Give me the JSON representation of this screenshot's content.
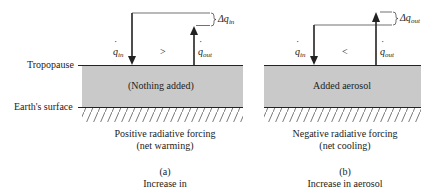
{
  "labels": {
    "tropopause": "Tropopause",
    "earth_surface": "Earth's surface"
  },
  "panel_a": {
    "layer_text": "(Nothing added)",
    "q_in": "q",
    "q_in_sub": "in",
    "q_out": "q",
    "q_out_sub": "out",
    "comparison": ">",
    "delta_label": "Δq",
    "delta_sub": "in",
    "caption_line1": "Positive radiative forcing",
    "caption_line2": "(net warming)",
    "letter": "(a)",
    "subtitle": "Increase in"
  },
  "panel_b": {
    "layer_text": "Added aerosol",
    "q_in": "q",
    "q_in_sub": "in",
    "q_out": "q",
    "q_out_sub": "out",
    "comparison": "<",
    "delta_label": "Δq",
    "delta_sub": "out",
    "caption_line1": "Negative radiative forcing",
    "caption_line2": "(net cooling)",
    "letter": "(b)",
    "subtitle": "Increase in aerosol"
  },
  "colors": {
    "atmosphere_fill": "#c9c9c9",
    "line": "#222222"
  }
}
